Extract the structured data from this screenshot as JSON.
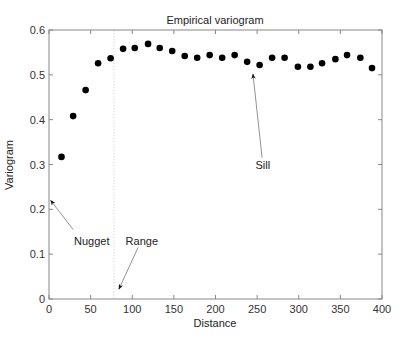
{
  "chart_data": {
    "type": "scatter",
    "title": "Empirical variogram",
    "xlabel": "Distance",
    "ylabel": "Variogram",
    "xlim": [
      0,
      400
    ],
    "ylim": [
      0,
      0.6
    ],
    "xticks": [
      0,
      50,
      100,
      150,
      200,
      250,
      300,
      350,
      400
    ],
    "yticks": [
      0,
      0.1,
      0.2,
      0.3,
      0.4,
      0.5,
      0.6
    ],
    "xtick_labels": [
      "0",
      "50",
      "100",
      "150",
      "200",
      "250",
      "300",
      "350",
      "400"
    ],
    "ytick_labels": [
      "0",
      "0.1",
      "0.2",
      "0.3",
      "0.4",
      "0.5",
      "0.6"
    ],
    "grid": false,
    "legend": null,
    "series": [
      {
        "name": "Empirical variogram",
        "color": "#000000",
        "x": [
          15,
          29,
          44,
          59,
          74,
          89,
          103,
          119,
          133,
          148,
          163,
          178,
          193,
          208,
          223,
          238,
          253,
          268,
          283,
          299,
          314,
          328,
          344,
          358,
          374,
          388
        ],
        "y": [
          0.317,
          0.408,
          0.466,
          0.526,
          0.537,
          0.558,
          0.56,
          0.569,
          0.56,
          0.553,
          0.542,
          0.538,
          0.544,
          0.538,
          0.544,
          0.529,
          0.522,
          0.538,
          0.538,
          0.518,
          0.518,
          0.526,
          0.535,
          0.544,
          0.538,
          0.515
        ]
      }
    ],
    "reference_lines": [
      {
        "name": "range-line",
        "orientation": "vertical",
        "x": 78,
        "style": "dotted",
        "color": "#d8d8d8"
      }
    ],
    "annotations": [
      {
        "text": "Nugget",
        "text_xy": [
          30,
          0.12
        ],
        "arrow_tip": [
          2,
          0.22
        ],
        "arrow_tail": [
          29,
          0.155
        ]
      },
      {
        "text": "Range",
        "text_xy": [
          92,
          0.12
        ],
        "arrow_tip": [
          84,
          0.022
        ],
        "arrow_tail": [
          107,
          0.115
        ]
      },
      {
        "text": "Sill",
        "text_xy": [
          248,
          0.29
        ],
        "arrow_tip": [
          245,
          0.502
        ],
        "arrow_tail": [
          256,
          0.315
        ]
      }
    ]
  },
  "layout": {
    "plot": {
      "left": 49,
      "top": 30,
      "right": 382,
      "bottom": 299
    },
    "frame_color": "#888888",
    "marker_radius": 3.3
  }
}
